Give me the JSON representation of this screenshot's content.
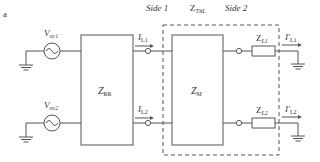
{
  "figure_label": "a",
  "header": {
    "side1": "Side 1",
    "zthl_main": "Z",
    "zthl_sub": "ThL",
    "side2": "Side 2"
  },
  "sources": [
    {
      "main": "V",
      "sub": "oc1"
    },
    {
      "main": "V",
      "sub": "oc2"
    }
  ],
  "blocks": {
    "zrr": {
      "main": "Z",
      "sub": "RR"
    },
    "zm": {
      "main": "Z",
      "sub": "M"
    }
  },
  "currents_in": [
    {
      "main": "I",
      "sub": "L1"
    },
    {
      "main": "I",
      "sub": "L2"
    }
  ],
  "loads": [
    {
      "main": "Z",
      "sub": "L1"
    },
    {
      "main": "Z",
      "sub": "L2"
    }
  ],
  "currents_out": [
    {
      "main": "I'",
      "sub": "L1"
    },
    {
      "main": "I'",
      "sub": "L2"
    }
  ]
}
